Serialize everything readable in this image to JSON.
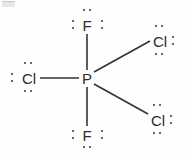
{
  "diagram": {
    "kind": "lewis-structure",
    "molecule_formula": "PF2Cl3",
    "center_atom": "P",
    "bond_color": "#333333",
    "atom_color": "#2b2b2b",
    "background_color": "#fefefe",
    "atoms": {
      "center": {
        "label": "P",
        "x": 87,
        "y": 78
      },
      "top_fluorine": {
        "label": "F",
        "x": 87,
        "y": 25
      },
      "bottom_fluorine": {
        "label": "F",
        "x": 87,
        "y": 135
      },
      "left_chlorine": {
        "label": "Cl",
        "x": 28,
        "y": 78
      },
      "top_right_chlorine": {
        "label": "Cl",
        "x": 160,
        "y": 41
      },
      "bottom_right_chlorine": {
        "label": "Cl",
        "x": 158,
        "y": 120
      }
    },
    "bonds": [
      {
        "from": "P",
        "to": "F",
        "label": "P-F top",
        "x1": 87,
        "y1": 70,
        "x2": 87,
        "y2": 34
      },
      {
        "from": "P",
        "to": "F",
        "label": "P-F bottom",
        "x1": 87,
        "y1": 87,
        "x2": 87,
        "y2": 126
      },
      {
        "from": "P",
        "to": "Cl",
        "label": "P-Cl left",
        "x1": 79,
        "y1": 78,
        "x2": 40,
        "y2": 78
      },
      {
        "from": "P",
        "to": "Cl",
        "label": "P-Cl upper right",
        "x1": 94,
        "y1": 72,
        "x2": 150,
        "y2": 41
      },
      {
        "from": "P",
        "to": "Cl",
        "label": "P-Cl lower right",
        "x1": 94,
        "y1": 84,
        "x2": 148,
        "y2": 114
      }
    ],
    "lone_pairs": {
      "top_fluorine": [
        "above",
        "left",
        "right"
      ],
      "bottom_fluorine": [
        "below",
        "left",
        "right"
      ],
      "left_chlorine": [
        "above",
        "below",
        "left"
      ],
      "top_right_chlorine": [
        "above",
        "below",
        "right"
      ],
      "bottom_right_chlorine": [
        "above",
        "below",
        "right"
      ]
    }
  }
}
